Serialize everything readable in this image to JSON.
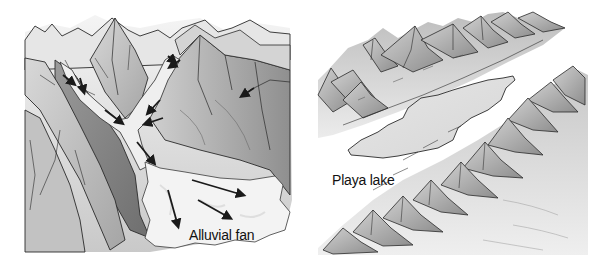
{
  "figure": {
    "panels": [
      {
        "id": "left",
        "subject": "alluvial fan formed where mountain streams exit canyon onto valley floor",
        "label": "Alluvial fan",
        "arrow_count": 10,
        "arrow_meaning": "direction of sediment-laden stream flow"
      },
      {
        "id": "right",
        "subject": "playa lake in basin between two parallel mountain ranges",
        "label": "Playa lake"
      }
    ],
    "colors": {
      "line": "#2a2a2a",
      "shade_dark": "#8a8a8a",
      "shade_mid": "#b5b5b5",
      "shade_light": "#dcdcdc",
      "fan_fill": "#f1f1f1",
      "lake_fill": "#e2e2e2",
      "background": "#ffffff"
    }
  }
}
